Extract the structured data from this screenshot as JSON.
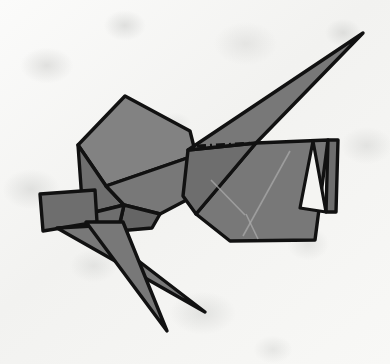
{
  "scene": {
    "title": "Origami Grasshopper Figure",
    "subject_name": "folded-paper-insect",
    "canvas": {
      "width": 390,
      "height": 364
    },
    "alt_text": "A gray origami folded-paper insect with a long pointed wing, angular head, folded tail flap and two slender legs, photographed on mottled off-white paper."
  },
  "colors": {
    "background_paper": "#f6f6f4",
    "paper_mottle": "#cdcdcb",
    "facet_fill": "#787878",
    "facet_fill_light": "#828282",
    "facet_fill_dark": "#6e6e6e",
    "facet_fill_darker": "#656565",
    "outline_stroke": "#111111",
    "crease_soft": "#a9a9a9",
    "flap_inner_white": "#f4f4f2"
  },
  "parts": [
    {
      "id": "head",
      "label": "Head panel",
      "fill_key": "facet_fill_light",
      "points": "125,96 78,145 106,186 196,155 190,131"
    },
    {
      "id": "head-lower-left",
      "label": "Head lower-left facet",
      "fill_key": "facet_fill_dark",
      "points": "78,145 83,215 124,205 106,186"
    },
    {
      "id": "head-lower-right",
      "label": "Head lower-right facet",
      "fill_key": "facet_fill",
      "points": "106,186 124,205 160,214 196,195 196,155"
    },
    {
      "id": "jaw-wedge",
      "label": "Jaw wedge facet",
      "fill_key": "facet_fill_darker",
      "points": "124,205 118,231 152,228 160,214"
    },
    {
      "id": "thorax-left",
      "label": "Thorax left facet",
      "fill_key": "facet_fill_dark",
      "points": "83,215 92,238 118,231 124,205"
    },
    {
      "id": "wing-spike",
      "label": "Long wing spike",
      "fill_key": "facet_fill",
      "points": "363,33 256,143 188,150"
    },
    {
      "id": "wing-underside",
      "label": "Wing underside facet",
      "fill_key": "facet_fill_dark",
      "points": "188,150 256,143 196,214 183,196"
    },
    {
      "id": "body-panel",
      "label": "Main body panel",
      "fill_key": "facet_fill",
      "points": "256,143 328,140 315,240 230,241 196,214"
    },
    {
      "id": "tail-flap-outer",
      "label": "Folded tail flap outer",
      "fill_key": "facet_fill_dark",
      "points": "328,140 338,140 336,212 326,212"
    },
    {
      "id": "tail-notch",
      "label": "Tail flap inner notch",
      "fill_key": "flap_inner_white",
      "points": "313,141 326,212 300,208"
    },
    {
      "id": "abdomen-quad",
      "label": "Left abdomen quad",
      "fill_key": "facet_fill_dark",
      "points": "40,194 95,190 97,222 43,231"
    },
    {
      "id": "leg-front",
      "label": "Front leg spike",
      "fill_key": "facet_fill",
      "points": "57,228 93,226 205,312"
    },
    {
      "id": "leg-rear",
      "label": "Rear leg spike",
      "fill_key": "facet_fill",
      "points": "86,222 123,222 167,331"
    }
  ],
  "creases": [
    {
      "id": "crease-body-diagonal",
      "label": "Body diagonal crease",
      "d": "M 290,151 L 243,236"
    },
    {
      "id": "crease-body-chevron",
      "label": "Body chevron crease",
      "d": "M 211,180 L 245,215"
    },
    {
      "id": "crease-body-short",
      "label": "Body short crease",
      "d": "M 246,214 L 258,239"
    }
  ],
  "fold_line": {
    "id": "dash-dot-fold",
    "label": "Dash-dot valley fold line",
    "d": "M 197,146 L 256,143",
    "dash_pattern": "9 4 2 4"
  }
}
